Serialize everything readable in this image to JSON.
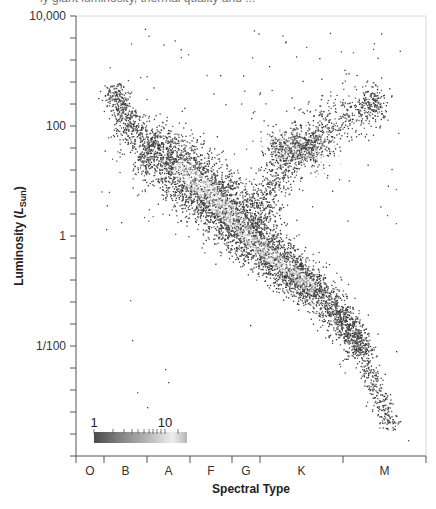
{
  "header": {
    "cutoff_text": "ly giant luminosity, thermal quality and ..."
  },
  "chart_data": {
    "type": "scatter",
    "title": "",
    "xlabel": "Spectral Type",
    "ylabel": "Luminosity (L_Sun)",
    "ylabel_main": "Luminosity (",
    "ylabel_italic": "L",
    "ylabel_sub": "Sun",
    "ylabel_close": ")",
    "yscale": "log",
    "ylim": [
      0.0001,
      10000
    ],
    "y_ticks": [
      {
        "value": 10000,
        "label": "10,000"
      },
      {
        "value": 100,
        "label": "100"
      },
      {
        "value": 1,
        "label": "1"
      },
      {
        "value": 0.01,
        "label": "1/100"
      }
    ],
    "x_categories": [
      "O",
      "B",
      "A",
      "F",
      "G",
      "K",
      "M"
    ],
    "x_category_boundaries_px": [
      76,
      104,
      147,
      190,
      232,
      260,
      343,
      426
    ],
    "grid": false,
    "colorbar": {
      "label_min": "1",
      "label_max": "10",
      "meaning": "star density (log scale)",
      "gradient": [
        "#4a4a4a",
        "#7a7a7a",
        "#a8a8a8",
        "#d0d0d0",
        "#ececec",
        "#b8b8b8"
      ]
    },
    "point_color": "#3a3a3a",
    "regions": [
      {
        "name": "Main Sequence",
        "from_spectral": "B",
        "to_spectral": "M",
        "luminosity_range": [
          1000,
          0.0005
        ],
        "density": "high, peak near F-G at ~1 L_Sun"
      },
      {
        "name": "Red Giant Clump",
        "spectral": "K",
        "luminosity_approx": 50,
        "density": "medium"
      },
      {
        "name": "Giant Branch",
        "from_spectral": "G",
        "to_spectral": "M",
        "luminosity_range": [
          5,
          300
        ],
        "density": "low-medium"
      },
      {
        "name": "Supergiants / scattered",
        "spectral_range": [
          "B",
          "M"
        ],
        "luminosity_range": [
          100,
          5000
        ],
        "density": "sparse"
      },
      {
        "name": "White dwarfs / outliers",
        "spectral_range": [
          "B",
          "A"
        ],
        "luminosity_range": [
          0.0005,
          0.005
        ],
        "density": "very sparse"
      }
    ]
  }
}
